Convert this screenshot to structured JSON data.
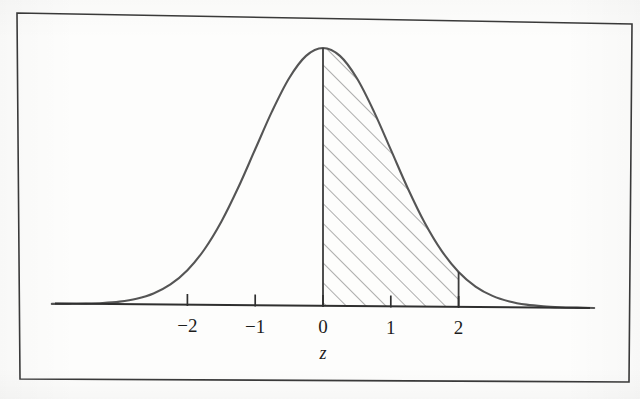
{
  "figure": {
    "caption_label": "standard-normal-curve",
    "background_color": "#fdfdfc",
    "ink_color": "#555555",
    "text_color": "#1d1d1d",
    "frame_color": "#3a3a3a"
  },
  "axis": {
    "title": "z",
    "tick_labels": [
      "−2",
      "−1",
      "0",
      "1",
      "2"
    ],
    "tick_values": [
      -2,
      -1,
      0,
      1,
      2
    ]
  },
  "chart_data": {
    "type": "area",
    "title": "",
    "subtitle": "",
    "xlabel": "z",
    "ylabel": "",
    "grid": false,
    "legend": null,
    "xlim": [
      -3.95,
      3.95
    ],
    "ylim": [
      0,
      0.4
    ],
    "x_ticks": [
      -2,
      -1,
      0,
      1,
      2
    ],
    "x_tick_labels": [
      "−2",
      "−1",
      "0",
      "1",
      "2"
    ],
    "y_ticks": [],
    "curve": {
      "name": "standard normal density",
      "distribution": "normal",
      "mean": 0,
      "sd": 1,
      "peak_value": 0.3989
    },
    "shaded_region": {
      "label": "area under curve between z = 0 and z = 2",
      "from": 0,
      "to": 2,
      "fill": "diagonal-hatch",
      "hatch_angle_deg": 45,
      "hatch_spacing_px": 14,
      "area": 0.4772
    },
    "boundary_lines": [
      {
        "at": 0,
        "kind": "vertical",
        "from_y": 0,
        "to_y": 0.3989
      },
      {
        "at": 2,
        "kind": "vertical",
        "from_y": 0,
        "to_y": 0.054
      }
    ],
    "series": [
      {
        "name": "standard normal density",
        "x": [
          -4.0,
          -3.75,
          -3.5,
          -3.25,
          -3.0,
          -2.75,
          -2.5,
          -2.25,
          -2.0,
          -1.75,
          -1.5,
          -1.25,
          -1.0,
          -0.75,
          -0.5,
          -0.25,
          0.0,
          0.25,
          0.5,
          0.75,
          1.0,
          1.25,
          1.5,
          1.75,
          2.0,
          2.25,
          2.5,
          2.75,
          3.0,
          3.25,
          3.5,
          3.75,
          4.0
        ],
        "values": [
          0.0001,
          0.0004,
          0.0009,
          0.002,
          0.0044,
          0.0091,
          0.0175,
          0.0317,
          0.054,
          0.0863,
          0.1295,
          0.1826,
          0.242,
          0.3011,
          0.3521,
          0.3867,
          0.3989,
          0.3867,
          0.3521,
          0.3011,
          0.242,
          0.1826,
          0.1295,
          0.0863,
          0.054,
          0.0317,
          0.0175,
          0.0091,
          0.0044,
          0.002,
          0.0009,
          0.0004,
          0.0001
        ]
      }
    ]
  }
}
